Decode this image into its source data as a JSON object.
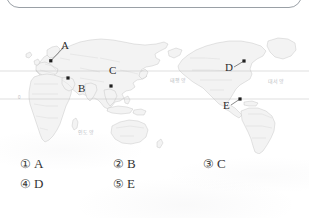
{
  "page": {
    "kind": "exam-question-page",
    "background_color": "#ffffff",
    "ink_color": "#3a3a3a"
  },
  "question_box": {
    "text": "",
    "border_color": "#9aa0a6"
  },
  "map": {
    "title": "",
    "type": "world-map",
    "land_fill": "#f2f2f2",
    "border_color": "#b6b6b6",
    "graticule": [
      {
        "name": "equator",
        "label": "",
        "y_px": 99
      },
      {
        "name": "upper-parallel",
        "label": "",
        "y_px": 71
      }
    ],
    "latitude_tick": "0",
    "ocean_labels": [
      {
        "name": "indian-ocean-label",
        "text": "인도양"
      },
      {
        "name": "pacific-ocean-label",
        "text": "태평양"
      },
      {
        "name": "atlantic-ocean-label",
        "text": "대서양"
      }
    ],
    "markers": [
      {
        "id": "A",
        "label": "A",
        "region": "Western Europe",
        "dot_x": 51,
        "dot_y": 61,
        "label_x": 61,
        "label_y": 44
      },
      {
        "id": "B",
        "label": "B",
        "region": "Southwest Asia",
        "dot_x": 68,
        "dot_y": 78,
        "label_x": 79,
        "label_y": 86
      },
      {
        "id": "C",
        "label": "C",
        "region": "East / Southeast Asia",
        "dot_x": 111,
        "dot_y": 86,
        "label_x": 110,
        "label_y": 68
      },
      {
        "id": "D",
        "label": "D",
        "region": "Eastern North America",
        "dot_x": 244,
        "dot_y": 61,
        "label_x": 225,
        "label_y": 65
      },
      {
        "id": "E",
        "label": "E",
        "region": "Northern South America",
        "dot_x": 240,
        "dot_y": 99,
        "label_x": 224,
        "label_y": 103
      }
    ]
  },
  "options": [
    {
      "num": "①",
      "value": "A"
    },
    {
      "num": "②",
      "value": "B"
    },
    {
      "num": "③",
      "value": "C"
    },
    {
      "num": "④",
      "value": "D"
    },
    {
      "num": "⑤",
      "value": "E"
    }
  ]
}
